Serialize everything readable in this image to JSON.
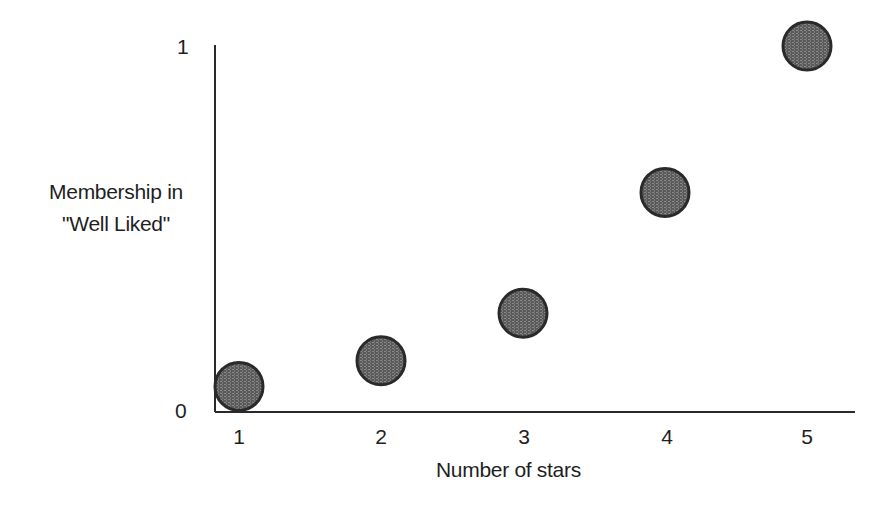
{
  "chart_data": {
    "type": "scatter",
    "title": "",
    "xlabel": "Number of stars",
    "ylabel_lines": [
      "Membership in",
      "\"Well Liked\""
    ],
    "ylabel": "Membership in \"Well Liked\"",
    "x_ticks": [
      "1",
      "2",
      "3",
      "4",
      "5"
    ],
    "y_ticks": [
      "0",
      "1"
    ],
    "xlim": [
      0.85,
      5.35
    ],
    "ylim": [
      0,
      1
    ],
    "grid": false,
    "legend": null,
    "series": [
      {
        "name": "Membership in \"Well Liked\"",
        "x": [
          1,
          2,
          3,
          4,
          5
        ],
        "y": [
          0.07,
          0.14,
          0.27,
          0.6,
          1.0
        ]
      }
    ],
    "marker": {
      "shape": "circle",
      "radius_px": 24,
      "fill": "#6e6e6e",
      "stroke": "#2a2a2a"
    }
  },
  "colors": {
    "axis": "#2a2a2a",
    "text": "#1e1e1e",
    "background": "#ffffff"
  }
}
